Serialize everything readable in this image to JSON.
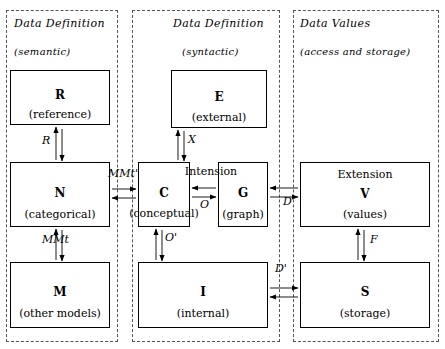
{
  "panels": [
    {
      "id": "semantic",
      "title": "Data Definition",
      "subtitle": "(semantic)"
    },
    {
      "id": "syntactic",
      "title": "Data Definition",
      "subtitle": "(syntactic)"
    },
    {
      "id": "values",
      "title": "Data Values",
      "subtitle": "(access and storage)"
    }
  ],
  "boxes": [
    {
      "id": "R",
      "letter": "R",
      "caption": "(reference)"
    },
    {
      "id": "N",
      "letter": "N",
      "caption": "(categorical)"
    },
    {
      "id": "M",
      "letter": "M",
      "caption": "(other models)"
    },
    {
      "id": "E",
      "letter": "E",
      "caption": "(external)"
    },
    {
      "id": "C",
      "letter": "C",
      "caption": "(conceptual)"
    },
    {
      "id": "G",
      "letter": "G",
      "caption": "(graph)"
    },
    {
      "id": "I",
      "letter": "I",
      "caption": "(internal)"
    },
    {
      "id": "V",
      "letter": "V",
      "caption": "(values)",
      "top": "Extension"
    },
    {
      "id": "S",
      "letter": "S",
      "caption": "(storage)"
    }
  ],
  "group_labels": {
    "intension": "Intension",
    "extension": "Extension"
  },
  "arrow_labels": {
    "R_N": "R",
    "N_C": "MMt'",
    "N_M": "MMt",
    "E_C": "X",
    "C_G": "O",
    "C_I": "O'",
    "G_V": "D",
    "I_S": "D'",
    "V_S": "F"
  },
  "colors": {
    "ink": "#000000",
    "panel_border": "#555555",
    "background": "#ffffff"
  }
}
